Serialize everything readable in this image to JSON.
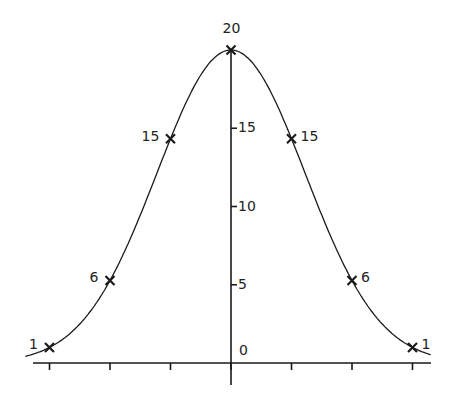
{
  "chart_data": {
    "type": "line",
    "title": "",
    "xlabel": "",
    "ylabel": "",
    "x": [
      -3,
      -2,
      -1,
      0,
      1,
      2,
      3
    ],
    "series": [
      {
        "name": "binomial coefficients (n=6)",
        "values": [
          1,
          6,
          15,
          20,
          15,
          6,
          1
        ],
        "marker": "x"
      }
    ],
    "point_labels": [
      "1",
      "6",
      "15",
      "20",
      "15",
      "6",
      "1"
    ],
    "y_ticks": [
      0,
      5,
      10,
      15
    ],
    "y_tick_labels": [
      "0",
      "5",
      "10",
      "15"
    ],
    "x_ticks": [
      -3,
      -2,
      -1,
      0,
      1,
      2,
      3
    ],
    "x_tick_labels": [],
    "ylim": [
      0,
      20
    ],
    "xlim": [
      -3.3,
      3.3
    ],
    "grid": false,
    "legend": "none",
    "curve": "smooth bell-shaped curve through points"
  },
  "colors": {
    "line": "#1a1a1a",
    "background": "#ffffff"
  }
}
